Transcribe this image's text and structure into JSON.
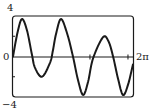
{
  "chart_data": {
    "type": "line",
    "title": "",
    "xlabel": "",
    "ylabel": "",
    "xlim": [
      0,
      6.2832
    ],
    "ylim": [
      -4,
      4
    ],
    "x_tick_labels": [
      "0",
      "2π"
    ],
    "y_tick_labels": [
      "4",
      "-4"
    ],
    "y_minor_ticks": [
      2,
      -2
    ],
    "x_minor_ticks": [
      4.03,
      6.02
    ],
    "grid": false,
    "legend": null,
    "series": [
      {
        "name": "f(x)",
        "x": [
          0,
          0.24,
          0.47,
          0.73,
          0.99,
          1.15,
          1.52,
          1.94,
          2.09,
          2.25,
          2.51,
          2.83,
          3.14,
          3.4,
          3.67,
          3.93,
          4.19,
          4.71,
          5.0,
          5.24,
          5.5,
          5.76,
          6.02,
          6.28
        ],
        "y": [
          0,
          2.4,
          3.7,
          2.6,
          0.2,
          -1.1,
          -2.0,
          -0.6,
          0.6,
          2.2,
          3.7,
          2.3,
          0.0,
          -2.3,
          -3.8,
          -2.5,
          -0.2,
          1.9,
          1.5,
          0.0,
          -2.2,
          -3.8,
          -2.8,
          -0.8
        ]
      }
    ]
  },
  "labels": {
    "y_top": "4",
    "y_bottom": "−4",
    "y_zero": "0",
    "x_end": "2π"
  },
  "colors": {
    "curve": "#1a1a1a",
    "frame": "#1a1a1a",
    "axis": "#1a1a1a"
  }
}
